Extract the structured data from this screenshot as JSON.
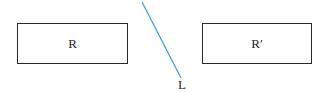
{
  "diagram": {
    "rectangle_original": {
      "label": "R"
    },
    "rectangle_image": {
      "label": "R′"
    },
    "mirror_line": {
      "label": "L",
      "color": "#4a9fd4"
    }
  }
}
